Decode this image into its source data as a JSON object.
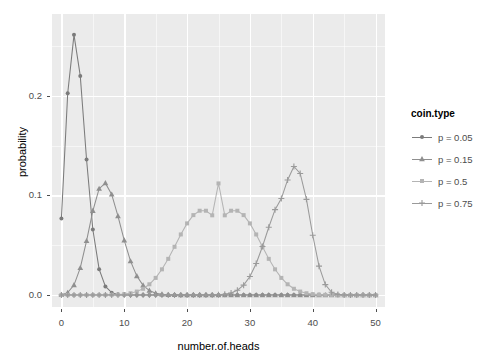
{
  "chart_data": {
    "type": "line",
    "title": "",
    "xlabel": "number.of.heads",
    "ylabel": "probability",
    "xlim": [
      -1.5,
      51.5
    ],
    "ylim": [
      -0.012,
      0.282
    ],
    "grid": true,
    "legend_position": "right",
    "legend_title": "coin.type",
    "x_ticks": [
      "0",
      "10",
      "20",
      "30",
      "40",
      "50"
    ],
    "x_tick_values": [
      0,
      10,
      20,
      30,
      40,
      50
    ],
    "x_minor_values": [
      5,
      15,
      25,
      35,
      45
    ],
    "y_ticks": [
      "0.0",
      "0.1",
      "0.2"
    ],
    "y_tick_values": [
      0.0,
      0.1,
      0.2
    ],
    "y_minor_values": [
      0.05,
      0.15,
      0.25
    ],
    "x": [
      0,
      1,
      2,
      3,
      4,
      5,
      6,
      7,
      8,
      9,
      10,
      11,
      12,
      13,
      14,
      15,
      16,
      17,
      18,
      19,
      20,
      21,
      22,
      23,
      24,
      25,
      26,
      27,
      28,
      29,
      30,
      31,
      32,
      33,
      34,
      35,
      36,
      37,
      38,
      39,
      40,
      41,
      42,
      43,
      44,
      45,
      46,
      47,
      48,
      49,
      50
    ],
    "series": [
      {
        "name": "p = 0.05",
        "shape": "circle",
        "color": "#7b7b7b",
        "values": [
          0.0769,
          0.2025,
          0.2611,
          0.2199,
          0.136,
          0.0658,
          0.026,
          0.0086,
          0.0024,
          0.0006,
          0.0001,
          0.0,
          0.0,
          0.0,
          0.0,
          0.0,
          0.0,
          0.0,
          0.0,
          0.0,
          0.0,
          0.0,
          0.0,
          0.0,
          0.0,
          0.0,
          0.0,
          0.0,
          0.0,
          0.0,
          0.0,
          0.0,
          0.0,
          0.0,
          0.0,
          0.0,
          0.0,
          0.0,
          0.0,
          0.0,
          0.0,
          0.0,
          0.0,
          0.0,
          0.0,
          0.0,
          0.0,
          0.0,
          0.0,
          0.0,
          0.0
        ]
      },
      {
        "name": "p = 0.15",
        "shape": "triangle",
        "color": "#8f8f8f",
        "values": [
          0.0003,
          0.0024,
          0.01,
          0.0272,
          0.0543,
          0.0845,
          0.1067,
          0.1123,
          0.101,
          0.0792,
          0.0549,
          0.034,
          0.019,
          0.0097,
          0.0045,
          0.0019,
          0.0007,
          0.0003,
          0.0001,
          0.0,
          0.0,
          0.0,
          0.0,
          0.0,
          0.0,
          0.0,
          0.0,
          0.0,
          0.0,
          0.0,
          0.0,
          0.0,
          0.0,
          0.0,
          0.0,
          0.0,
          0.0,
          0.0,
          0.0,
          0.0,
          0.0,
          0.0,
          0.0,
          0.0,
          0.0,
          0.0,
          0.0,
          0.0,
          0.0,
          0.0,
          0.0
        ]
      },
      {
        "name": "p = 0.5",
        "shape": "square",
        "color": "#b4b4b4",
        "values": [
          0.0,
          0.0,
          0.0,
          0.0,
          0.0,
          0.0,
          0.0,
          0.0,
          0.0,
          0.0,
          0.0,
          0.0,
          0.0001,
          0.0002,
          0.0004,
          0.0008,
          0.0016,
          0.003,
          0.0053,
          0.0086,
          0.0128,
          0.0177,
          0.0227,
          0.027,
          0.0299,
          0.0112,
          0.0299,
          0.027,
          0.0227,
          0.0177,
          0.0128,
          0.0086,
          0.0053,
          0.003,
          0.0016,
          0.0008,
          0.0004,
          0.0002,
          0.0001,
          0.0,
          0.0,
          0.0,
          0.0,
          0.0,
          0.0,
          0.0,
          0.0,
          0.0,
          0.0,
          0.0,
          0.0
        ],
        "values_plot": [
          0.0,
          0.0,
          0.0,
          0.0,
          0.0,
          0.0,
          0.0,
          0.0001,
          0.0002,
          0.0004,
          0.0009,
          0.0018,
          0.0035,
          0.0063,
          0.0108,
          0.0172,
          0.0258,
          0.0363,
          0.0484,
          0.0608,
          0.0719,
          0.0802,
          0.0846,
          0.0846,
          0.08,
          0.112,
          0.08,
          0.0846,
          0.0846,
          0.0802,
          0.0719,
          0.0608,
          0.0484,
          0.0363,
          0.0258,
          0.0172,
          0.0108,
          0.0063,
          0.0035,
          0.0018,
          0.0009,
          0.0004,
          0.0002,
          0.0001,
          0.0,
          0.0,
          0.0,
          0.0,
          0.0,
          0.0,
          0.0
        ]
      },
      {
        "name": "p = 0.75",
        "shape": "plus",
        "color": "#9a9a9a",
        "values": [
          0.0,
          0.0,
          0.0,
          0.0,
          0.0,
          0.0,
          0.0,
          0.0,
          0.0,
          0.0,
          0.0,
          0.0,
          0.0,
          0.0,
          0.0,
          0.0,
          0.0,
          0.0,
          0.0,
          0.0,
          0.0,
          0.0,
          0.0,
          0.0001,
          0.0002,
          0.0006,
          0.0014,
          0.0031,
          0.0064,
          0.0121,
          0.0208,
          0.0327,
          0.047,
          0.0617,
          0.0735,
          0.0788,
          0.0755,
          0.0639,
          0.0472,
          0.0298,
          0.0157,
          0.0066,
          0.0021,
          0.0005,
          0.0001,
          0.0,
          0.0,
          0.0,
          0.0,
          0.0,
          0.0
        ],
        "values_plot": [
          0.0,
          0.0,
          0.0,
          0.0,
          0.0,
          0.0,
          0.0,
          0.0,
          0.0,
          0.0,
          0.0,
          0.0,
          0.0,
          0.0,
          0.0,
          0.0,
          0.0,
          0.0,
          0.0,
          0.0,
          0.0,
          0.0,
          0.0,
          0.0,
          0.0001,
          0.0003,
          0.0008,
          0.0021,
          0.0048,
          0.0099,
          0.0186,
          0.0316,
          0.0487,
          0.068,
          0.0857,
          0.0968,
          0.1155,
          0.129,
          0.122,
          0.096,
          0.06,
          0.029,
          0.0105,
          0.0028,
          0.0006,
          0.0001,
          0.0,
          0.0,
          0.0,
          0.0,
          0.0
        ]
      }
    ]
  },
  "axis": {
    "x_title": "number.of.heads",
    "y_title": "probability"
  },
  "legend": {
    "title": "coin.type",
    "items": [
      {
        "label": "p = 0.05",
        "shape": "circle",
        "color": "#7b7b7b"
      },
      {
        "label": "p = 0.15",
        "shape": "triangle",
        "color": "#8f8f8f"
      },
      {
        "label": "p = 0.5",
        "shape": "square",
        "color": "#b4b4b4"
      },
      {
        "label": "p = 0.75",
        "shape": "plus",
        "color": "#9a9a9a"
      }
    ]
  },
  "theme": {
    "panel_bg": "#ebebeb",
    "grid_color": "#ffffff",
    "text_color": "#4d4d4d"
  }
}
